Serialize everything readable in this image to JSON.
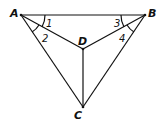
{
  "diagram": {
    "points": {
      "A": {
        "label": "A",
        "x": 21,
        "y": 15
      },
      "B": {
        "label": "B",
        "x": 145,
        "y": 15
      },
      "D": {
        "label": "D",
        "x": 83,
        "y": 49
      },
      "C": {
        "label": "C",
        "x": 83,
        "y": 107
      }
    },
    "segments": [
      "AB",
      "AD",
      "AC",
      "BD",
      "BC",
      "DC"
    ],
    "angles": [
      {
        "label": "1",
        "vertex": "A",
        "between": [
          "AB",
          "AD"
        ]
      },
      {
        "label": "2",
        "vertex": "A",
        "between": [
          "AD",
          "AC"
        ]
      },
      {
        "label": "3",
        "vertex": "B",
        "between": [
          "BA",
          "BD"
        ]
      },
      {
        "label": "4",
        "vertex": "B",
        "between": [
          "BD",
          "BC"
        ]
      }
    ],
    "stroke_color": "#111111"
  }
}
